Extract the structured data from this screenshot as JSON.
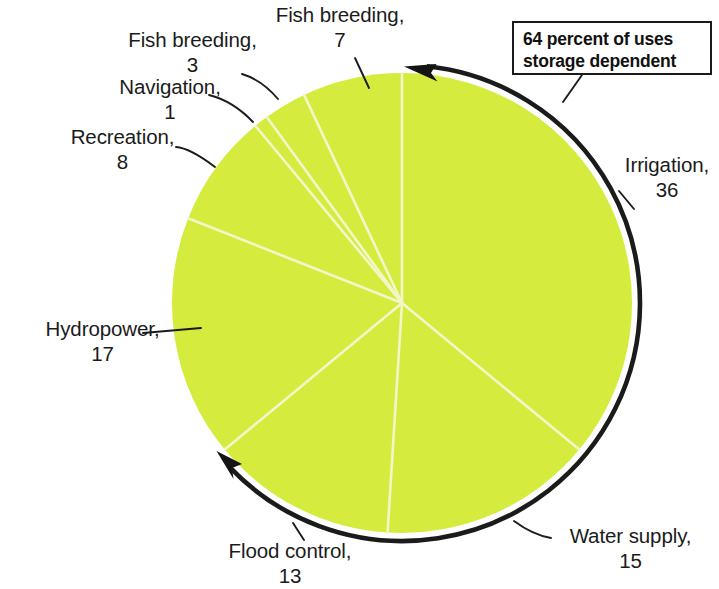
{
  "figure": {
    "type": "pie-chart",
    "background_color": "#ffffff",
    "slice_fill_color": "#d5ec3f",
    "slice_divider_color": "#f2f7c9",
    "outline_color": "#1b1b1b",
    "text_color": "#1b1b1b"
  },
  "callout": {
    "name": "storage-dependent-callout",
    "line1": "64 percent of uses",
    "line2": "storage dependent",
    "value": 64,
    "border_color": "#1b1b1b"
  },
  "labels": {
    "irrigation": {
      "name": "Irrigation,",
      "value": "36"
    },
    "water_supply": {
      "name": "Water supply,",
      "value": "15"
    },
    "flood_control": {
      "name": "Flood control,",
      "value": "13"
    },
    "hydropower": {
      "name": "Hydropower,",
      "value": "17"
    },
    "recreation": {
      "name": "Recreation,",
      "value": "8"
    },
    "navigation": {
      "name": "Navigation,",
      "value": "1"
    },
    "fish_breeding_3": {
      "name": "Fish breeding,",
      "value": "3"
    },
    "fish_breeding_7": {
      "name": "Fish breeding,",
      "value": "7"
    }
  },
  "chart_data": {
    "type": "pie",
    "title": "",
    "subtitle": "",
    "xlabel": "",
    "ylabel": "",
    "grid": false,
    "legend_position": "none",
    "units": "percent",
    "total": 100,
    "labels": [
      "Irrigation",
      "Water supply",
      "Flood control",
      "Hydropower",
      "Recreation",
      "Navigation",
      "Fish breeding",
      "Fish breeding"
    ],
    "values": [
      36,
      15,
      13,
      17,
      8,
      1,
      3,
      7
    ],
    "slices": [
      {
        "label": "Irrigation",
        "value": 36,
        "start_deg": 0,
        "end_deg": 129.6,
        "storage_dependent": true
      },
      {
        "label": "Water supply",
        "value": 15,
        "start_deg": 129.6,
        "end_deg": 183.6,
        "storage_dependent": true
      },
      {
        "label": "Flood control",
        "value": 13,
        "start_deg": 183.6,
        "end_deg": 230.4,
        "storage_dependent": true
      },
      {
        "label": "Hydropower",
        "value": 17,
        "start_deg": 230.4,
        "end_deg": 291.6,
        "storage_dependent": false
      },
      {
        "label": "Recreation",
        "value": 8,
        "start_deg": 291.6,
        "end_deg": 320.4,
        "storage_dependent": false
      },
      {
        "label": "Navigation",
        "value": 1,
        "start_deg": 320.4,
        "end_deg": 324.0,
        "storage_dependent": false
      },
      {
        "label": "Fish breeding",
        "value": 3,
        "start_deg": 324.0,
        "end_deg": 334.8,
        "storage_dependent": false
      },
      {
        "label": "Fish breeding",
        "value": 7,
        "start_deg": 334.8,
        "end_deg": 360.0,
        "storage_dependent": false
      }
    ],
    "annotations": [
      {
        "text": "64 percent of uses storage dependent",
        "value": 64,
        "covers": [
          "Irrigation",
          "Water supply",
          "Flood control"
        ]
      }
    ],
    "arc_indicator": {
      "name": "storage-dependent-arc",
      "spans_percent": 64,
      "double_headed": true
    }
  }
}
